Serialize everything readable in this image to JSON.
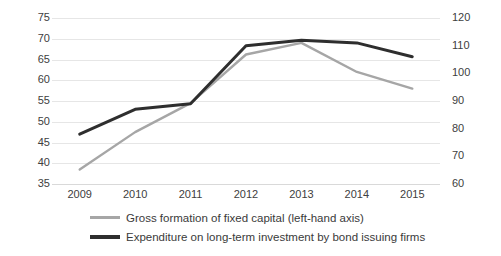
{
  "chart_data": {
    "type": "line",
    "title": "",
    "xlabel": "",
    "categories": [
      "2009",
      "2010",
      "2011",
      "2012",
      "2013",
      "2014",
      "2015"
    ],
    "grid": true,
    "legend_position": "bottom",
    "axes": {
      "left": {
        "label": "",
        "ylim": [
          35,
          75
        ],
        "ticks": [
          75,
          70,
          65,
          60,
          55,
          50,
          45,
          40,
          35
        ],
        "step": 5
      },
      "right": {
        "label": "",
        "ylim": [
          60,
          120
        ],
        "ticks": [
          120,
          110,
          100,
          90,
          80,
          70,
          60
        ],
        "step": 10
      }
    },
    "series": [
      {
        "name": "Gross formation of fixed capital (left-hand axis)",
        "axis": "left",
        "color": "#a6a6a6",
        "values": [
          38.5,
          47.5,
          54.5,
          66.2,
          69.0,
          62.0,
          58.0
        ]
      },
      {
        "name": "Expenditure on long-term investment by bond issuing firms",
        "axis": "right",
        "color": "#2e2e2e",
        "values": [
          78.0,
          87.0,
          89.0,
          110.0,
          112.0,
          111.0,
          106.0
        ]
      }
    ]
  },
  "legend": {
    "items": [
      {
        "label": "Gross formation of fixed capital (left-hand axis)",
        "swatch": "gross"
      },
      {
        "label": "Expenditure on long-term investment by bond issuing firms",
        "swatch": "expenditure"
      }
    ]
  }
}
